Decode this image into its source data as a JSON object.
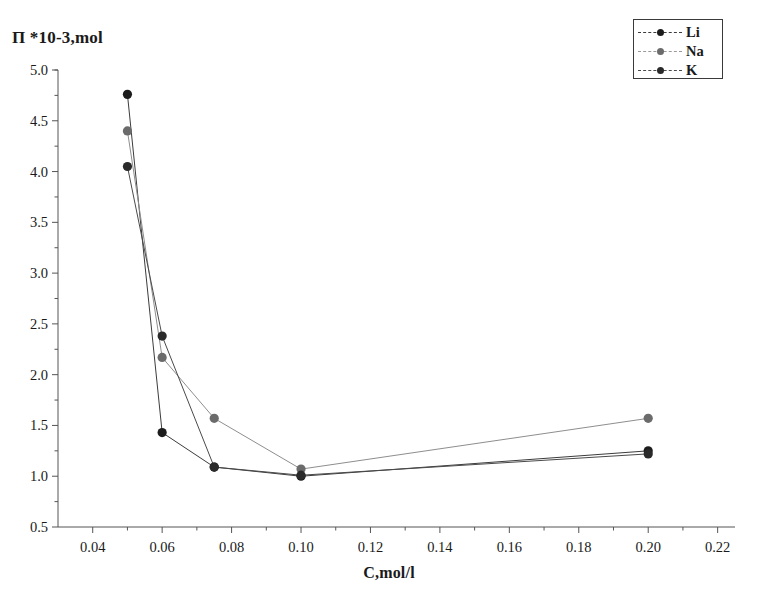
{
  "chart_data": {
    "type": "line",
    "title": "",
    "xlabel": "C,mol/l",
    "ylabel": "П *10-3,mol",
    "xlim": [
      0.03,
      0.225
    ],
    "ylim": [
      0.5,
      5.0
    ],
    "xticks": [
      "0.04",
      "0.06",
      "0.08",
      "0.10",
      "0.12",
      "0.14",
      "0.16",
      "0.18",
      "0.20",
      "0.22"
    ],
    "xtick_values": [
      0.04,
      0.06,
      0.08,
      0.1,
      0.12,
      0.14,
      0.16,
      0.18,
      0.2,
      0.22
    ],
    "yticks": [
      "0.5",
      "1.0",
      "1.5",
      "2.0",
      "2.5",
      "3.0",
      "3.5",
      "4.0",
      "4.5",
      "5.0"
    ],
    "ytick_values": [
      0.5,
      1.0,
      1.5,
      2.0,
      2.5,
      3.0,
      3.5,
      4.0,
      4.5,
      5.0
    ],
    "grid": false,
    "legend_position": "top-right",
    "x": [
      0.05,
      0.06,
      0.075,
      0.1,
      0.2
    ],
    "series": [
      {
        "name": "Li",
        "color": "#1c1c1c",
        "line_color": "#3c3c3c",
        "values": [
          4.76,
          1.43,
          1.09,
          1.0,
          1.25
        ]
      },
      {
        "name": "Na",
        "color": "#6b6b6b",
        "line_color": "#8e8e8e",
        "values": [
          4.4,
          2.17,
          1.57,
          1.07,
          1.57
        ]
      },
      {
        "name": "K",
        "color": "#2a2a2a",
        "line_color": "#4a4a4a",
        "values": [
          4.05,
          2.38,
          1.09,
          1.01,
          1.22
        ]
      }
    ]
  },
  "axis": {
    "color": "#555555",
    "line_width": 1
  },
  "legend": {
    "entries": [
      {
        "label": "Li",
        "marker_color": "#1c1c1c",
        "line_color": "#3c3c3c"
      },
      {
        "label": "Na",
        "marker_color": "#6b6b6b",
        "line_color": "#9a9a9a"
      },
      {
        "label": "K",
        "marker_color": "#2a2a2a",
        "line_color": "#4a4a4a"
      }
    ]
  }
}
